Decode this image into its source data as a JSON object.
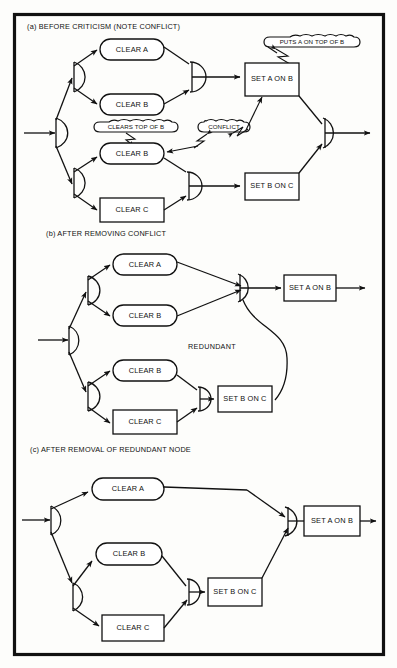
{
  "figure": {
    "panels": [
      {
        "id": "a",
        "title": "(a) BEFORE CRITICISM (NOTE CONFLICT)",
        "nodes": [
          {
            "id": "a-clear-a",
            "label": "CLEAR A",
            "shape": "rounded"
          },
          {
            "id": "a-clear-b1",
            "label": "CLEAR B",
            "shape": "rounded"
          },
          {
            "id": "a-clear-b2",
            "label": "CLEAR B",
            "shape": "rounded"
          },
          {
            "id": "a-clear-c",
            "label": "CLEAR C",
            "shape": "rect"
          },
          {
            "id": "a-set-a-on-b",
            "label": "SET A ON B",
            "shape": "rect"
          },
          {
            "id": "a-set-b-on-c",
            "label": "SET B ON C",
            "shape": "rect"
          }
        ],
        "clouds": [
          {
            "id": "a-cloud-puts",
            "label": "PUTS A ON TOP OF B"
          },
          {
            "id": "a-cloud-clears",
            "label": "CLEARS TOP OF B"
          },
          {
            "id": "a-cloud-conflict",
            "label": "CONFLICT"
          }
        ],
        "annotations": []
      },
      {
        "id": "b",
        "title": "(b) AFTER REMOVING CONFLICT",
        "nodes": [
          {
            "id": "b-clear-a",
            "label": "CLEAR A",
            "shape": "rounded"
          },
          {
            "id": "b-clear-b1",
            "label": "CLEAR B",
            "shape": "rounded"
          },
          {
            "id": "b-clear-b2",
            "label": "CLEAR B",
            "shape": "rounded"
          },
          {
            "id": "b-clear-c",
            "label": "CLEAR C",
            "shape": "rect"
          },
          {
            "id": "b-set-a-on-b",
            "label": "SET A ON B",
            "shape": "rect"
          },
          {
            "id": "b-set-b-on-c",
            "label": "SET B ON C",
            "shape": "rect"
          }
        ],
        "clouds": [],
        "annotations": [
          {
            "id": "b-redundant",
            "label": "REDUNDANT"
          }
        ]
      },
      {
        "id": "c",
        "title": "(c) AFTER REMOVAL OF REDUNDANT NODE",
        "nodes": [
          {
            "id": "c-clear-a",
            "label": "CLEAR A",
            "shape": "rounded"
          },
          {
            "id": "c-clear-b",
            "label": "CLEAR B",
            "shape": "rounded"
          },
          {
            "id": "c-clear-c",
            "label": "CLEAR C",
            "shape": "rect"
          },
          {
            "id": "c-set-a-on-b",
            "label": "SET A ON B",
            "shape": "rect"
          },
          {
            "id": "c-set-b-on-c",
            "label": "SET B ON C",
            "shape": "rect"
          }
        ],
        "clouds": [],
        "annotations": []
      }
    ],
    "colors": {
      "ink": "#111111",
      "paper": "#fdfdfb",
      "frame": "#111111"
    }
  }
}
